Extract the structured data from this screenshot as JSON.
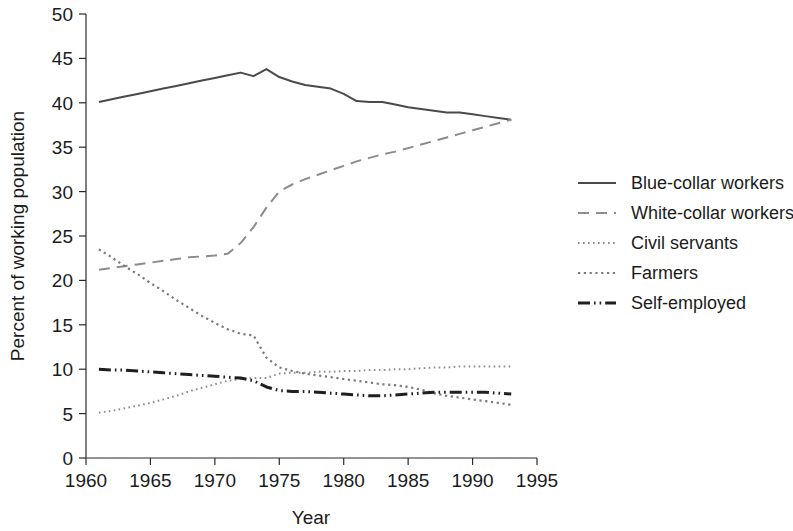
{
  "chart_data": {
    "type": "line",
    "title": "",
    "xlabel": "Year",
    "ylabel": "Percent of working population",
    "xlim": [
      1960,
      1995
    ],
    "ylim": [
      0,
      50
    ],
    "xticks": [
      1960,
      1965,
      1970,
      1975,
      1980,
      1985,
      1990,
      1995
    ],
    "yticks": [
      0,
      5,
      10,
      15,
      20,
      25,
      30,
      35,
      40,
      45,
      50
    ],
    "grid": false,
    "legend_position": "right",
    "series": [
      {
        "name": "Blue-collar workers",
        "style": "solid",
        "color": "#4a4a4a",
        "x": [
          1961,
          1962,
          1963,
          1964,
          1965,
          1966,
          1967,
          1968,
          1969,
          1970,
          1971,
          1972,
          1973,
          1974,
          1975,
          1976,
          1977,
          1978,
          1979,
          1980,
          1981,
          1982,
          1983,
          1984,
          1985,
          1986,
          1987,
          1988,
          1989,
          1990,
          1991,
          1992,
          1993
        ],
        "values": [
          40.1,
          40.4,
          40.7,
          41.0,
          41.3,
          41.6,
          41.9,
          42.2,
          42.5,
          42.8,
          43.1,
          43.4,
          43.0,
          43.8,
          42.9,
          42.4,
          42.0,
          41.8,
          41.6,
          41.0,
          40.2,
          40.1,
          40.1,
          39.8,
          39.5,
          39.3,
          39.1,
          38.9,
          38.9,
          38.7,
          38.5,
          38.3,
          38.1
        ]
      },
      {
        "name": "White-collar workers",
        "style": "dashed",
        "color": "#8c8c8c",
        "x": [
          1961,
          1962,
          1963,
          1964,
          1965,
          1966,
          1967,
          1968,
          1969,
          1970,
          1971,
          1972,
          1973,
          1974,
          1975,
          1976,
          1977,
          1978,
          1979,
          1980,
          1981,
          1982,
          1983,
          1984,
          1985,
          1986,
          1987,
          1988,
          1989,
          1990,
          1991,
          1992,
          1993
        ],
        "values": [
          21.2,
          21.4,
          21.6,
          21.8,
          22.0,
          22.2,
          22.4,
          22.6,
          22.7,
          22.8,
          23.0,
          24.2,
          26.0,
          28.2,
          30.0,
          30.8,
          31.4,
          31.9,
          32.4,
          32.9,
          33.4,
          33.8,
          34.2,
          34.5,
          34.9,
          35.3,
          35.7,
          36.1,
          36.5,
          36.9,
          37.3,
          37.7,
          38.1
        ]
      },
      {
        "name": "Civil servants",
        "style": "dotted-fine",
        "color": "#8c8c8c",
        "x": [
          1961,
          1962,
          1963,
          1964,
          1965,
          1966,
          1967,
          1968,
          1969,
          1970,
          1971,
          1972,
          1973,
          1974,
          1975,
          1976,
          1977,
          1978,
          1979,
          1980,
          1981,
          1982,
          1983,
          1984,
          1985,
          1986,
          1987,
          1988,
          1989,
          1990,
          1991,
          1992,
          1993
        ],
        "values": [
          5.1,
          5.3,
          5.6,
          5.9,
          6.2,
          6.6,
          7.0,
          7.5,
          7.9,
          8.3,
          8.7,
          8.9,
          9.0,
          9.0,
          9.5,
          9.6,
          9.6,
          9.7,
          9.7,
          9.8,
          9.8,
          9.9,
          9.9,
          10.0,
          10.0,
          10.1,
          10.2,
          10.2,
          10.3,
          10.3,
          10.3,
          10.3,
          10.3
        ]
      },
      {
        "name": "Farmers",
        "style": "dotted",
        "color": "#7a7a7a",
        "x": [
          1961,
          1962,
          1963,
          1964,
          1965,
          1966,
          1967,
          1968,
          1969,
          1970,
          1971,
          1972,
          1973,
          1974,
          1975,
          1976,
          1977,
          1978,
          1979,
          1980,
          1981,
          1982,
          1983,
          1984,
          1985,
          1986,
          1987,
          1988,
          1989,
          1990,
          1991,
          1992,
          1993
        ],
        "values": [
          23.5,
          22.6,
          21.6,
          20.7,
          19.7,
          18.8,
          17.8,
          16.9,
          16.0,
          15.2,
          14.5,
          14.0,
          13.8,
          11.3,
          10.2,
          9.8,
          9.5,
          9.3,
          9.1,
          8.9,
          8.7,
          8.5,
          8.3,
          8.2,
          8.0,
          7.7,
          7.3,
          7.0,
          6.8,
          6.6,
          6.4,
          6.2,
          6.0
        ]
      },
      {
        "name": "Self-employed",
        "style": "dash-dot",
        "color": "#1f1f1f",
        "x": [
          1961,
          1962,
          1963,
          1964,
          1965,
          1966,
          1967,
          1968,
          1969,
          1970,
          1971,
          1972,
          1973,
          1974,
          1975,
          1976,
          1977,
          1978,
          1979,
          1980,
          1981,
          1982,
          1983,
          1984,
          1985,
          1986,
          1987,
          1988,
          1989,
          1990,
          1991,
          1992,
          1993
        ],
        "values": [
          10.0,
          9.9,
          9.9,
          9.8,
          9.7,
          9.6,
          9.5,
          9.4,
          9.3,
          9.2,
          9.1,
          9.0,
          8.7,
          8.0,
          7.6,
          7.5,
          7.5,
          7.4,
          7.3,
          7.2,
          7.1,
          7.0,
          7.0,
          7.1,
          7.2,
          7.3,
          7.4,
          7.4,
          7.4,
          7.4,
          7.4,
          7.3,
          7.2
        ]
      }
    ]
  },
  "legend": {
    "items": [
      {
        "label": "Blue-collar workers"
      },
      {
        "label": "White-collar workers"
      },
      {
        "label": "Civil servants"
      },
      {
        "label": "Farmers"
      },
      {
        "label": "Self-employed"
      }
    ]
  }
}
